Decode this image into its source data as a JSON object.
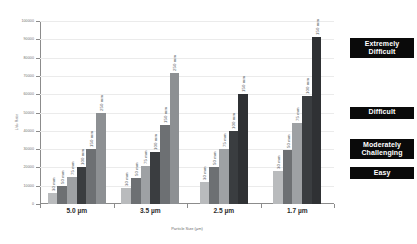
{
  "chart_data": {
    "type": "bar",
    "title": "",
    "xlabel": "Particle Size (µm)",
    "ylabel": "L/dₚ Ratio",
    "ylim": [
      0,
      100000
    ],
    "ytick_step": 10000,
    "yticks": [
      "0",
      "10000",
      "20000",
      "30000",
      "40000",
      "50000",
      "60000",
      "70000",
      "80000",
      "90000",
      "100000"
    ],
    "grid": true,
    "legend_position": "right",
    "categories": [
      "5.0 µm",
      "3.5 µm",
      "2.5 µm",
      "1.7 µm"
    ],
    "series_axis": "column length (mm)",
    "groups": [
      {
        "category": "5.0 µm",
        "bars": [
          {
            "label": "30 mm",
            "value": 6000,
            "color": "#b9bbbd"
          },
          {
            "label": "50 mm",
            "value": 10000,
            "color": "#6d7073"
          },
          {
            "label": "75 mm",
            "value": 15000,
            "color": "#9ea1a4"
          },
          {
            "label": "100 mm",
            "value": 20000,
            "color": "#3a3d40"
          },
          {
            "label": "150 mm",
            "value": 30000,
            "color": "#6d7073"
          },
          {
            "label": "250 mm",
            "value": 50000,
            "color": "#8d9093"
          }
        ]
      },
      {
        "category": "3.5 µm",
        "bars": [
          {
            "label": "30 mm",
            "value": 8500,
            "color": "#b9bbbd"
          },
          {
            "label": "50 mm",
            "value": 14000,
            "color": "#6d7073"
          },
          {
            "label": "75 mm",
            "value": 21000,
            "color": "#9ea1a4"
          },
          {
            "label": "100 mm",
            "value": 28500,
            "color": "#3a3d40"
          },
          {
            "label": "150 mm",
            "value": 43000,
            "color": "#6d7073"
          },
          {
            "label": "250 mm",
            "value": 71500,
            "color": "#8d9093"
          }
        ]
      },
      {
        "category": "2.5 µm",
        "bars": [
          {
            "label": "30 mm",
            "value": 12000,
            "color": "#b9bbbd"
          },
          {
            "label": "50 mm",
            "value": 20000,
            "color": "#6d7073"
          },
          {
            "label": "75 mm",
            "value": 30000,
            "color": "#9ea1a4"
          },
          {
            "label": "100 mm",
            "value": 40000,
            "color": "#3a3d40"
          },
          {
            "label": "150 mm",
            "value": 60000,
            "color": "#2f3134"
          }
        ]
      },
      {
        "category": "1.7 µm",
        "bars": [
          {
            "label": "30 mm",
            "value": 18000,
            "color": "#b9bbbd"
          },
          {
            "label": "50 mm",
            "value": 29500,
            "color": "#6d7073"
          },
          {
            "label": "75 mm",
            "value": 44000,
            "color": "#9ea1a4"
          },
          {
            "label": "100 mm",
            "value": 59000,
            "color": "#3a3d40"
          },
          {
            "label": "150 mm",
            "value": 91000,
            "color": "#2f3134"
          }
        ]
      }
    ]
  },
  "legend": {
    "items": [
      {
        "label": "Extremely Difficult",
        "threshold": 85000
      },
      {
        "label": "Difficult",
        "threshold": 50000
      },
      {
        "label": "Moderately Challenging",
        "threshold": 30000
      },
      {
        "label": "Easy",
        "threshold": 17000
      }
    ]
  },
  "style": {
    "legend_bg": "#0a0a0a",
    "legend_fg": "#ffffff",
    "axis_color": "#8c8c8c",
    "grid_color": "#ebebeb",
    "text_color": "#6e6e6e"
  }
}
